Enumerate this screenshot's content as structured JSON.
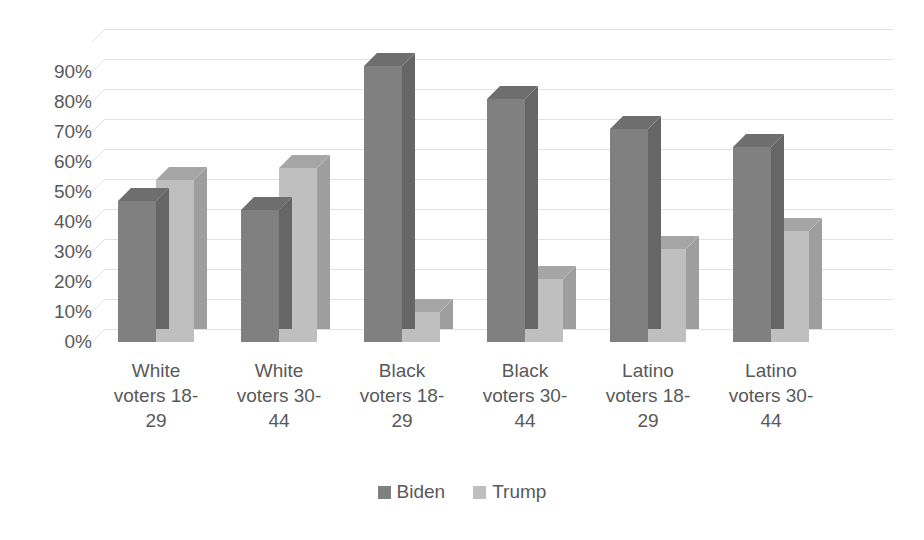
{
  "chart_data": {
    "type": "bar",
    "title": "",
    "subtitle": "",
    "xlabel": "",
    "ylabel": "",
    "ylim": [
      0,
      100
    ],
    "ytick_labels": [
      "90%",
      "80%",
      "70%",
      "60%",
      "50%",
      "40%",
      "30%",
      "20%",
      "10%",
      "0%"
    ],
    "ytick_values": [
      90,
      80,
      70,
      60,
      50,
      40,
      30,
      20,
      10,
      0
    ],
    "grid": true,
    "three_d": true,
    "legend_position": "bottom",
    "categories": [
      "White voters 18-29",
      "White voters 30-44",
      "Black voters 18-29",
      "Black voters 30-44",
      "Latino voters 18-29",
      "Latino voters 30-44"
    ],
    "category_lines": [
      [
        "White",
        "voters 18-",
        "29"
      ],
      [
        "White",
        "voters 30-",
        "44"
      ],
      [
        "Black",
        "voters 18-",
        "29"
      ],
      [
        "Black",
        "voters 30-",
        "44"
      ],
      [
        "Latino",
        "voters 18-",
        "29"
      ],
      [
        "Latino",
        "voters 30-",
        "44"
      ]
    ],
    "series": [
      {
        "name": "Biden",
        "color": "#808080",
        "values": [
          47,
          44,
          92,
          81,
          71,
          65
        ]
      },
      {
        "name": "Trump",
        "color": "#bfbfbf",
        "values": [
          54,
          58,
          10,
          21,
          31,
          37
        ]
      }
    ]
  },
  "legend": {
    "items": [
      {
        "label": "Biden",
        "color": "#808080"
      },
      {
        "label": "Trump",
        "color": "#bfbfbf"
      }
    ]
  },
  "colors": {
    "biden": "#808080",
    "biden_top": "#6e6e6e",
    "biden_side": "#666666",
    "trump": "#bfbfbf",
    "trump_top": "#a6a6a6",
    "trump_side": "#9e9e9e",
    "gridline": "#e2e2e2",
    "text": "#595959",
    "background": "#ffffff"
  }
}
